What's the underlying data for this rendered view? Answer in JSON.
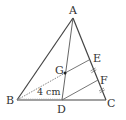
{
  "figure": {
    "type": "triangle-geometry",
    "points": {
      "A": {
        "label": "A"
      },
      "B": {
        "label": "B"
      },
      "C": {
        "label": "C"
      },
      "D": {
        "label": "D"
      },
      "E": {
        "label": "E"
      },
      "F": {
        "label": "F"
      },
      "G": {
        "label": "G"
      }
    },
    "measurements": {
      "BG": "4 cm"
    },
    "segments": [
      "AB",
      "AC",
      "BC",
      "AD",
      "BE",
      "DF"
    ],
    "equal_marks": [
      "EF",
      "FC"
    ],
    "colors": {
      "line": "#444444",
      "text": "#333333",
      "background": "#ffffff"
    }
  }
}
